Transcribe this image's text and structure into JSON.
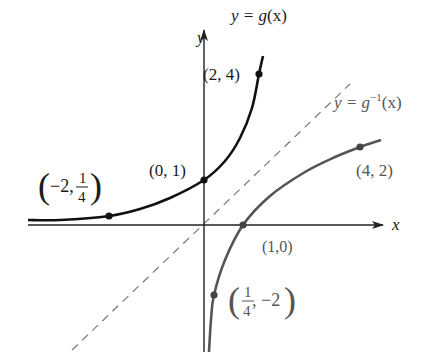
{
  "figure": {
    "colors": {
      "g_curve": "#111111",
      "inverse_curve": "#555555",
      "axes": "#222222",
      "dashed_line": "#777777",
      "background": "#ffffff"
    }
  },
  "axes": {
    "x_label": "x",
    "y_label": "y",
    "origin_px": [
      204,
      225
    ]
  },
  "curves": {
    "g": {
      "label_lhs": "y = g(x)",
      "label_text": "y = ",
      "label_func": "g",
      "label_arg": "(x)",
      "path_px": [
        [
          28,
          220
        ],
        [
          60,
          220
        ],
        [
          109,
          216
        ],
        [
          140,
          209
        ],
        [
          170,
          198
        ],
        [
          204,
          180
        ],
        [
          225,
          161
        ],
        [
          240,
          138
        ],
        [
          252,
          108
        ],
        [
          259,
          74
        ],
        [
          263,
          56
        ]
      ]
    },
    "g_inverse": {
      "label_text": "y = ",
      "label_func": "g",
      "label_sup": "−1",
      "label_arg": "(x)",
      "path_px": [
        [
          209,
          352
        ],
        [
          211,
          320
        ],
        [
          214,
          295
        ],
        [
          225,
          260
        ],
        [
          243,
          225
        ],
        [
          270,
          196
        ],
        [
          305,
          172
        ],
        [
          335,
          157
        ],
        [
          360,
          147
        ],
        [
          381,
          140
        ]
      ]
    },
    "identity_line": {
      "label": "y = x",
      "from_px": [
        72,
        350
      ],
      "to_px": [
        350,
        84
      ]
    }
  },
  "points": [
    {
      "label": "(2, 4)",
      "px": [
        259,
        74
      ]
    },
    {
      "label": "(0, 1)",
      "px": [
        204,
        180
      ]
    },
    {
      "label": "(-2, 1/4)",
      "px": [
        109,
        216
      ]
    },
    {
      "label": "(4, 2)",
      "px": [
        360,
        147
      ]
    },
    {
      "label": "(1,0)",
      "px": [
        243,
        225
      ]
    },
    {
      "label": "(1/4, -2)",
      "px": [
        214,
        295
      ]
    }
  ],
  "labels": {
    "p_2_4": "(2, 4)",
    "p_0_1": "(0, 1)",
    "p_m2_quarter_open": "(",
    "p_m2_quarter_x": "−2,",
    "p_m2_quarter_num": "1",
    "p_m2_quarter_den": "4",
    "p_m2_quarter_close": ")",
    "p_4_2": "(4, 2)",
    "p_1_0": "(1,0)",
    "p_quarter_m2_open": "(",
    "p_quarter_m2_num": "1",
    "p_quarter_m2_den": "4",
    "p_quarter_m2_y": ", −2",
    "p_quarter_m2_close": ")"
  }
}
